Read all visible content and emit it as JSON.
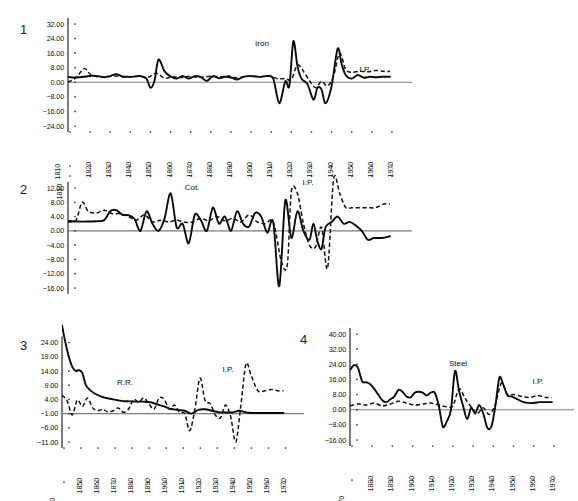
{
  "figure": {
    "background": "#ffffff",
    "solid_color": "#0a0a0a",
    "dashed_color": "#121212",
    "zero_color": "#7c7c7c"
  },
  "panels": [
    {
      "number": "1",
      "ylabels": [
        "32.00",
        "24.00",
        "16.00",
        "8.00",
        "0.00",
        "-8.00",
        "-16.00",
        "-24.00"
      ],
      "origin_label": "1810",
      "xlabels": [
        "1820",
        "1830",
        "1840",
        "1850",
        "1860",
        "1870",
        "1880",
        "1890",
        "1900",
        "1910",
        "1920",
        "1930",
        "1940",
        "1950",
        "1960",
        "1970"
      ],
      "series_labels": [
        "Iron",
        "I.P."
      ]
    },
    {
      "number": "2",
      "ylabels": [
        "12.00",
        "8.00",
        "4.00",
        "0.00",
        "-4.00",
        "-8.00",
        "-12.00",
        "-16.00"
      ],
      "origin_label": "1810",
      "xlabels": [],
      "series_labels": [
        "Cot.",
        "I.P."
      ]
    },
    {
      "number": "3",
      "ylabels": [
        "24.00",
        "19.00",
        "14.00",
        "9.00",
        "4.00",
        "-1.00",
        "-6.00",
        "-11.00"
      ],
      "origin_label": "1840",
      "xlabels": [
        "1850",
        "1860",
        "1870",
        "1880",
        "1890",
        "1900",
        "1910",
        "1920",
        "1930",
        "1940",
        "1950",
        "1960",
        "1970"
      ],
      "series_labels": [
        "R.R.",
        "I.P."
      ]
    },
    {
      "number": "4",
      "ylabels": [
        "40.00",
        "32.00",
        "24.00",
        "16.00",
        "8.00",
        "0.00",
        "-8.00",
        "-16.00"
      ],
      "origin_label": "1870",
      "xlabels": [
        "1880",
        "1890",
        "1900",
        "1910",
        "1920",
        "1930",
        "1940",
        "1950",
        "1960",
        "1970"
      ],
      "series_labels": [
        "Steel",
        "I.P."
      ]
    }
  ],
  "chart_data": [
    {
      "type": "line",
      "panel": "1",
      "title": "",
      "xlabel": "",
      "ylabel": "",
      "xlim": [
        1810,
        1975
      ],
      "ylim": [
        -24,
        32
      ],
      "yticks": [
        32,
        24,
        16,
        8,
        0,
        -8,
        -16,
        -24
      ],
      "xticks": [
        1810,
        1820,
        1830,
        1840,
        1850,
        1860,
        1870,
        1880,
        1890,
        1900,
        1910,
        1920,
        1930,
        1940,
        1950,
        1960,
        1970
      ],
      "grid": false,
      "legend": "inline-annotation",
      "series": [
        {
          "name": "Iron",
          "style": "solid",
          "x": [
            1810,
            1813,
            1816,
            1819,
            1822,
            1825,
            1828,
            1831,
            1834,
            1837,
            1840,
            1843,
            1846,
            1849,
            1851,
            1853,
            1855,
            1858,
            1861,
            1864,
            1867,
            1870,
            1873,
            1876,
            1879,
            1882,
            1885,
            1888,
            1891,
            1894,
            1897,
            1900,
            1903,
            1906,
            1909,
            1912,
            1915,
            1918,
            1920,
            1922,
            1924,
            1926,
            1929,
            1932,
            1934,
            1936,
            1938,
            1941,
            1944,
            1946,
            1948,
            1951,
            1954,
            1957,
            1960,
            1963,
            1966,
            1970
          ],
          "y": [
            3.0,
            2.6,
            2.8,
            3.2,
            3.6,
            3.4,
            2.8,
            3.4,
            4.5,
            3.2,
            3.0,
            3.1,
            3.4,
            2.0,
            -3.0,
            1.0,
            12.5,
            6.0,
            3.2,
            2.0,
            3.5,
            2.0,
            3.4,
            2.8,
            0.8,
            3.3,
            2.2,
            3.0,
            2.6,
            1.5,
            3.0,
            3.4,
            3.2,
            3.0,
            3.4,
            2.0,
            -11.5,
            0.5,
            -2.0,
            22.5,
            9.0,
            2.0,
            -1.0,
            -9.5,
            -3.0,
            -4.0,
            -11.5,
            -2.0,
            18.5,
            10.0,
            4.0,
            2.0,
            4.0,
            2.5,
            3.0,
            2.8,
            3.0,
            3.0
          ]
        },
        {
          "name": "I.P.",
          "style": "dashed",
          "x": [
            1810,
            1814,
            1818,
            1821,
            1824,
            1827,
            1830,
            1834,
            1838,
            1842,
            1846,
            1850,
            1854,
            1858,
            1862,
            1866,
            1870,
            1874,
            1878,
            1882,
            1886,
            1890,
            1894,
            1898,
            1902,
            1906,
            1910,
            1914,
            1918,
            1921,
            1924,
            1927,
            1930,
            1933,
            1936,
            1939,
            1942,
            1945,
            1948,
            1951,
            1955,
            1959,
            1963,
            1967,
            1970
          ],
          "y": [
            0.0,
            2.5,
            7.5,
            4.5,
            3.2,
            3.0,
            3.2,
            3.4,
            3.0,
            3.2,
            3.3,
            2.8,
            5.0,
            2.2,
            3.0,
            2.6,
            3.2,
            2.8,
            3.0,
            3.4,
            3.0,
            3.4,
            2.4,
            3.2,
            3.4,
            3.0,
            3.5,
            2.0,
            2.0,
            1.5,
            9.5,
            6.0,
            1.0,
            -3.0,
            0.5,
            -2.0,
            3.5,
            16.0,
            7.0,
            5.5,
            6.0,
            5.8,
            6.5,
            6.0,
            6.0
          ]
        }
      ]
    },
    {
      "type": "line",
      "panel": "2",
      "title": "",
      "xlabel": "",
      "ylabel": "",
      "xlim": [
        1810,
        1975
      ],
      "ylim": [
        -16,
        12
      ],
      "yticks": [
        12,
        8,
        4,
        0,
        -4,
        -8,
        -12,
        -16
      ],
      "xticks": [
        1810,
        1820,
        1830,
        1840,
        1850,
        1860,
        1870,
        1880,
        1890,
        1900,
        1910,
        1920,
        1930,
        1940,
        1950,
        1960,
        1970
      ],
      "grid": false,
      "legend": "inline-annotation",
      "series": [
        {
          "name": "Cot.",
          "style": "solid",
          "x": [
            1810,
            1815,
            1820,
            1824,
            1828,
            1831,
            1834,
            1837,
            1840,
            1843,
            1846,
            1849,
            1852,
            1855,
            1858,
            1861,
            1864,
            1867,
            1870,
            1873,
            1876,
            1879,
            1882,
            1885,
            1888,
            1891,
            1894,
            1897,
            1900,
            1903,
            1906,
            1909,
            1912,
            1915,
            1918,
            1921,
            1924,
            1927,
            1930,
            1932,
            1934,
            1936,
            1938,
            1941,
            1944,
            1947,
            1950,
            1953,
            1956,
            1959,
            1962,
            1966,
            1970
          ],
          "y": [
            2.8,
            2.6,
            2.6,
            2.7,
            3.0,
            5.5,
            5.8,
            4.5,
            4.4,
            3.4,
            0.0,
            5.5,
            2.0,
            0.0,
            3.5,
            10.5,
            1.0,
            2.0,
            -3.5,
            4.5,
            3.0,
            0.0,
            6.5,
            2.0,
            4.0,
            0.0,
            5.5,
            2.0,
            1.2,
            5.0,
            4.0,
            -0.5,
            2.5,
            -15.5,
            8.5,
            -2.0,
            5.5,
            0.0,
            -2.5,
            2.0,
            -3.0,
            -5.0,
            1.0,
            2.5,
            4.0,
            2.0,
            2.5,
            1.5,
            0.0,
            -2.5,
            -2.0,
            -2.0,
            -1.5
          ]
        },
        {
          "name": "I.P.",
          "style": "dashed",
          "x": [
            1810,
            1814,
            1817,
            1820,
            1824,
            1828,
            1832,
            1836,
            1840,
            1844,
            1848,
            1852,
            1856,
            1860,
            1864,
            1868,
            1872,
            1876,
            1880,
            1884,
            1888,
            1892,
            1896,
            1900,
            1904,
            1908,
            1912,
            1916,
            1919,
            1921,
            1924,
            1927,
            1930,
            1933,
            1936,
            1939,
            1942,
            1945,
            1948,
            1951,
            1955,
            1959,
            1963,
            1967,
            1970
          ],
          "y": [
            2.5,
            3.0,
            8.0,
            5.5,
            5.0,
            5.8,
            4.8,
            4.8,
            4.0,
            3.0,
            4.5,
            2.5,
            3.0,
            2.5,
            3.0,
            2.4,
            2.5,
            3.5,
            2.8,
            4.0,
            2.8,
            3.5,
            2.5,
            4.5,
            2.5,
            2.0,
            2.5,
            -8.5,
            -9.5,
            11.0,
            10.5,
            2.0,
            -4.0,
            -4.5,
            1.0,
            -10.5,
            14.5,
            10.5,
            6.5,
            6.5,
            6.5,
            6.5,
            6.5,
            7.5,
            7.5
          ]
        }
      ]
    },
    {
      "type": "line",
      "panel": "3",
      "title": "",
      "xlabel": "",
      "ylabel": "",
      "xlim": [
        1840,
        1975
      ],
      "ylim": [
        -11,
        27
      ],
      "yticks": [
        24,
        19,
        14,
        9,
        4,
        -1,
        -6,
        -11
      ],
      "xticks": [
        1840,
        1850,
        1860,
        1870,
        1880,
        1890,
        1900,
        1910,
        1920,
        1930,
        1940,
        1950,
        1960,
        1970
      ],
      "grid": false,
      "legend": "inline-annotation",
      "series": [
        {
          "name": "R.R.",
          "style": "solid",
          "x": [
            1840,
            1842,
            1844,
            1846,
            1848,
            1850,
            1852,
            1854,
            1857,
            1860,
            1864,
            1868,
            1872,
            1876,
            1880,
            1884,
            1888,
            1892,
            1896,
            1900,
            1904,
            1908,
            1912,
            1916,
            1920,
            1924,
            1928,
            1932,
            1936,
            1940,
            1944,
            1948,
            1952,
            1956,
            1960,
            1965,
            1970
          ],
          "y": [
            30.0,
            24.0,
            19.0,
            15.5,
            14.0,
            14.3,
            13.2,
            9.0,
            7.0,
            5.8,
            4.8,
            4.2,
            3.8,
            3.4,
            3.3,
            3.2,
            3.2,
            3.0,
            2.2,
            1.5,
            0.6,
            0.3,
            0.0,
            -1.0,
            0.3,
            0.5,
            0.0,
            -0.5,
            -0.6,
            -0.6,
            0.0,
            -0.6,
            -0.8,
            -0.8,
            -0.8,
            -0.8,
            -0.8
          ]
        },
        {
          "name": "I.P.",
          "style": "dashed",
          "x": [
            1840,
            1843,
            1846,
            1849,
            1852,
            1855,
            1858,
            1861,
            1864,
            1867,
            1870,
            1873,
            1876,
            1879,
            1882,
            1885,
            1888,
            1891,
            1894,
            1897,
            1900,
            1903,
            1906,
            1909,
            1912,
            1915,
            1918,
            1921,
            1924,
            1927,
            1930,
            1933,
            1936,
            1939,
            1942,
            1945,
            1948,
            1951,
            1955,
            1959,
            1963,
            1967,
            1970
          ],
          "y": [
            5.5,
            3.5,
            -1.5,
            3.8,
            1.5,
            4.5,
            1.0,
            0.0,
            0.5,
            -0.5,
            0.0,
            1.0,
            -0.5,
            0.5,
            4.0,
            3.0,
            4.5,
            2.5,
            0.5,
            4.5,
            4.0,
            0.5,
            2.0,
            -0.5,
            -1.0,
            -7.0,
            0.5,
            11.5,
            3.5,
            2.5,
            -1.5,
            -2.5,
            2.0,
            -2.0,
            -11.0,
            2.0,
            16.5,
            12.5,
            7.0,
            7.0,
            7.5,
            7.0,
            7.0
          ]
        }
      ]
    },
    {
      "type": "line",
      "panel": "4",
      "title": "",
      "xlabel": "",
      "ylabel": "",
      "xlim": [
        1870,
        1975
      ],
      "ylim": [
        -16,
        40
      ],
      "yticks": [
        40,
        32,
        24,
        16,
        8,
        0,
        -8,
        -16
      ],
      "xticks": [
        1870,
        1880,
        1890,
        1900,
        1910,
        1920,
        1930,
        1940,
        1950,
        1960,
        1970
      ],
      "grid": false,
      "legend": "inline-annotation",
      "series": [
        {
          "name": "Steel",
          "style": "solid",
          "x": [
            1870,
            1872,
            1874,
            1876,
            1878,
            1880,
            1882,
            1884,
            1886,
            1888,
            1890,
            1892,
            1894,
            1896,
            1898,
            1900,
            1902,
            1904,
            1906,
            1908,
            1910,
            1912,
            1914,
            1916,
            1918,
            1920,
            1922,
            1924,
            1926,
            1928,
            1930,
            1932,
            1934,
            1936,
            1938,
            1940,
            1942,
            1944,
            1946,
            1948,
            1950,
            1953,
            1956,
            1960,
            1964,
            1967,
            1970
          ],
          "y": [
            21.0,
            23.5,
            22.0,
            15.0,
            14.5,
            13.5,
            11.0,
            8.0,
            5.0,
            4.0,
            5.5,
            7.0,
            10.5,
            9.5,
            7.0,
            6.5,
            9.0,
            9.5,
            9.0,
            7.5,
            9.0,
            9.0,
            2.0,
            -9.0,
            -6.0,
            0.0,
            20.5,
            10.0,
            2.0,
            -5.0,
            1.0,
            -2.0,
            2.5,
            -2.0,
            -9.5,
            -9.0,
            2.0,
            17.0,
            13.0,
            7.5,
            7.0,
            5.5,
            4.0,
            3.5,
            4.0,
            4.0,
            4.0
          ]
        },
        {
          "name": "I.P.",
          "style": "dashed",
          "x": [
            1870,
            1874,
            1878,
            1882,
            1886,
            1890,
            1894,
            1898,
            1902,
            1906,
            1910,
            1914,
            1918,
            1921,
            1924,
            1927,
            1930,
            1933,
            1936,
            1939,
            1942,
            1945,
            1948,
            1951,
            1955,
            1959,
            1963,
            1967,
            1970
          ],
          "y": [
            2.0,
            3.0,
            2.5,
            3.5,
            2.0,
            3.0,
            4.5,
            3.5,
            2.5,
            3.0,
            3.5,
            2.5,
            1.5,
            2.0,
            11.0,
            6.0,
            1.5,
            -2.0,
            1.0,
            -2.5,
            3.0,
            14.0,
            8.0,
            8.0,
            7.0,
            6.5,
            7.5,
            6.5,
            6.5
          ]
        }
      ]
    }
  ]
}
